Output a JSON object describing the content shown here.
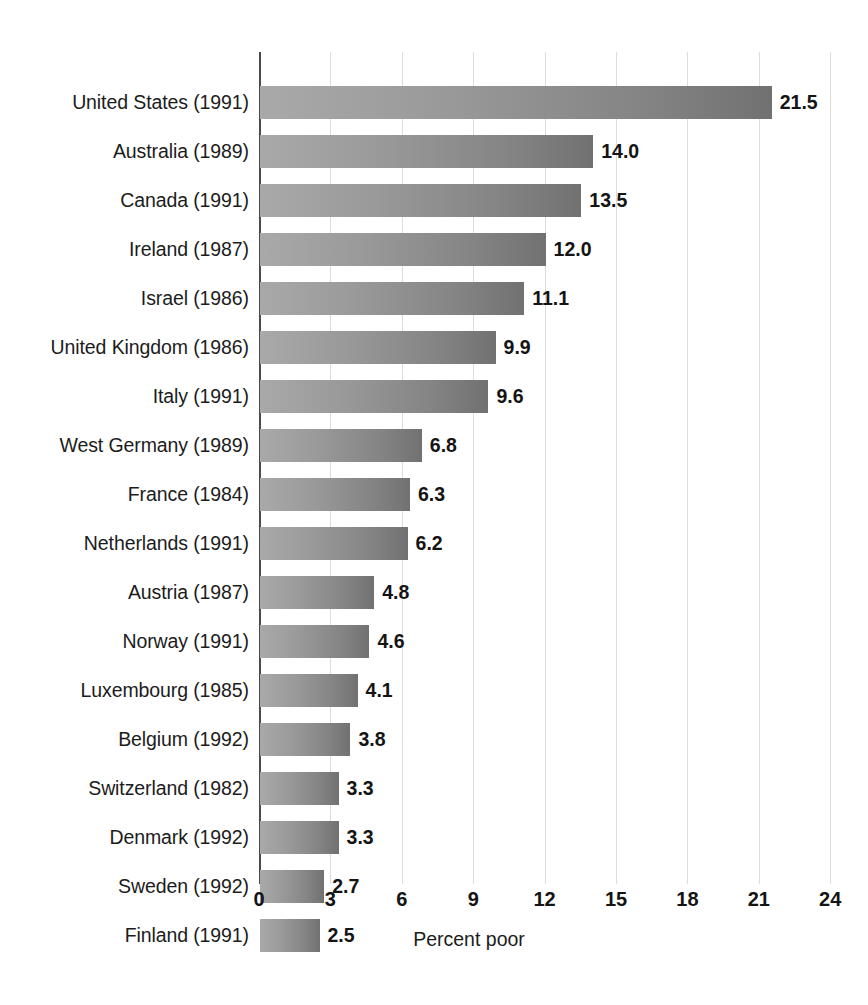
{
  "chart_data": {
    "type": "bar",
    "orientation": "horizontal",
    "title": "",
    "xlabel": "Percent poor",
    "ylabel": "",
    "xlim": [
      0,
      24
    ],
    "xticks": [
      "0",
      "3",
      "6",
      "9",
      "12",
      "15",
      "18",
      "21",
      "24"
    ],
    "grid": true,
    "legend": "none",
    "categories": [
      "United States (1991)",
      "Australia (1989)",
      "Canada (1991)",
      "Ireland (1987)",
      "Israel (1986)",
      "United Kingdom (1986)",
      "Italy (1991)",
      "West Germany (1989)",
      "France (1984)",
      "Netherlands (1991)",
      "Austria (1987)",
      "Norway (1991)",
      "Luxembourg (1985)",
      "Belgium (1992)",
      "Switzerland (1982)",
      "Denmark (1992)",
      "Sweden (1992)",
      "Finland (1991)"
    ],
    "values": [
      21.5,
      14.0,
      13.5,
      12.0,
      11.1,
      9.9,
      9.6,
      6.8,
      6.3,
      6.2,
      4.8,
      4.6,
      4.1,
      3.8,
      3.3,
      3.3,
      2.7,
      2.5
    ],
    "value_labels": [
      "21.5",
      "14.0",
      "13.5",
      "12.0",
      "11.1",
      "9.9",
      "9.6",
      "6.8",
      "6.3",
      "6.2",
      "4.8",
      "4.6",
      "4.1",
      "3.8",
      "3.3",
      "3.3",
      "2.7",
      "2.5"
    ],
    "colors": {
      "bar_light": "#a9a9a9",
      "bar_dark": "#717171",
      "gridline": "#dcdcdc",
      "axis": "#4a4a4a",
      "text": "#1c1c1c",
      "background": "#ffffff"
    }
  }
}
